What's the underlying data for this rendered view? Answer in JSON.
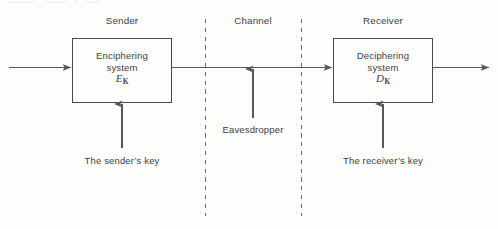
{
  "diagram": {
    "zones": [
      {
        "id": "sender",
        "label": "Sender",
        "x": 122
      },
      {
        "id": "channel",
        "label": "Channel",
        "x": 253
      },
      {
        "id": "receiver",
        "label": "Receiver",
        "x": 383
      }
    ],
    "boxes": [
      {
        "id": "enciphering",
        "line1": "Enciphering",
        "line2": "system",
        "symbol": "E",
        "symbol_subscript": "K"
      },
      {
        "id": "deciphering",
        "line1": "Deciphering",
        "line2": "system",
        "symbol": "D",
        "symbol_subscript": "K"
      }
    ],
    "keys": [
      {
        "id": "sender-key",
        "label": "The sender’s key",
        "x": 122
      },
      {
        "id": "receiver-key",
        "label": "The receiver’s key",
        "x": 383
      }
    ],
    "attacker": {
      "id": "eavesdropper",
      "label": "Eavesdropper",
      "x": 253
    },
    "colors": {
      "line": "#585858",
      "box_border": "#4a4a4a",
      "dashed": "#6b6b6b",
      "text": "#3d3d3d",
      "background": "#fdfdfc"
    }
  }
}
